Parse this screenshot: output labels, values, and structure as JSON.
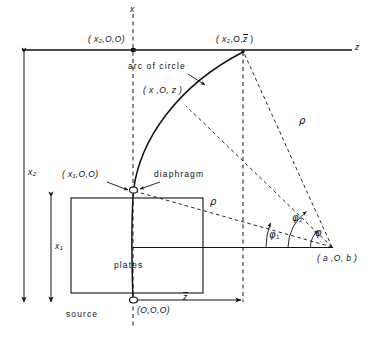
{
  "figure": {
    "type": "schematic-diagram"
  },
  "axes": {
    "x_axis_label": "x",
    "z_axis_label": "z"
  },
  "points": {
    "p_x2_0_0": "( x₂,O,O)",
    "p_x2_0_zbar_open": "( x",
    "p_x2_0_zbar_sub": "2",
    "p_x2_0_zbar_mid": ",O,",
    "p_x2_0_zbar_bar": "z",
    "p_x2_0_zbar_close": " )",
    "p_x_0_z": "( x ,O, z )",
    "p_x1_0_0": "( x₁,O,O)",
    "p_origin": "(O,O,O)",
    "p_a_0_b": "( a ,O, b )"
  },
  "annotations": {
    "arc_of_circle": "arc of circle",
    "diaphragm": "diaphragm",
    "plates": "plates",
    "source": "source",
    "rho_upper": "ρ",
    "rho_lower": "ρ",
    "phi_1": "φ",
    "phi_1_sub": "1",
    "phi_2": "φ",
    "phi_2_sub": "2",
    "phi": "φ",
    "dim_x2": "x",
    "dim_x2_sub": "2",
    "dim_x1": "x",
    "dim_x1_sub": "1",
    "dim_zbar": "z"
  },
  "colors": {
    "ink": "#121212",
    "background": "#ffffff"
  },
  "geometry_values": {
    "z_axis_y": 50,
    "x_axis_x": 133,
    "origin": [
      133,
      300
    ],
    "focus_point": [
      333,
      248
    ],
    "arc_top": [
      243,
      52
    ],
    "diaphragm": [
      133,
      190
    ],
    "plates_rect": [
      71,
      198,
      132,
      95
    ],
    "zbar_x": 243
  }
}
